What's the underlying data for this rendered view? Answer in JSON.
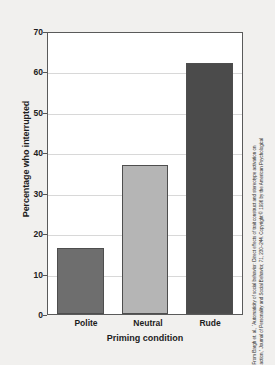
{
  "chart_data": {
    "type": "bar",
    "title": "",
    "xlabel": "Priming condition",
    "ylabel": "Percentage who interrupted",
    "categories": [
      "Polite",
      "Neutral",
      "Rude"
    ],
    "values": [
      16.5,
      37.0,
      62.5
    ],
    "series": [
      {
        "name": "Percentage who interrupted",
        "values": [
          16.5,
          37.0,
          62.5
        ]
      }
    ],
    "bar_colors": [
      "#6e6e6e",
      "#b5b5b5",
      "#4b4b4b"
    ],
    "ylim": [
      0,
      70
    ],
    "yticks": [
      0,
      10,
      20,
      30,
      40,
      50,
      60,
      70
    ],
    "ytick_labels": [
      "0",
      "10",
      "20",
      "30",
      "40",
      "50",
      "60",
      "70"
    ],
    "grid": true,
    "grid_axis": "y",
    "legend": false,
    "legend_position": "none",
    "plot_background": "#ffffff",
    "figure_background": "#f1f0ee",
    "axis_color": "#5a5a5a",
    "gridline_color": "#d8d8d8"
  },
  "credit": {
    "line1": "From Bargh et. al., “Automaticity of social behavior: Direct effects of trait construct and stereotype activation on",
    "line2": "action,” Journal of Personality and Social Behavior, 71, 230–244. Copyright © 1996 by the American Psychological"
  }
}
